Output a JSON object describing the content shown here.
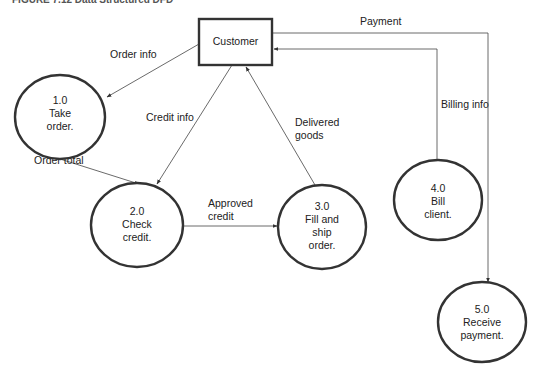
{
  "caption": "FIGURE 7.12  Data Structured DFD",
  "entities": [
    {
      "id": "customer",
      "label": "Customer"
    }
  ],
  "processes": [
    {
      "id": "p1",
      "lines": [
        "1.0",
        "Take",
        "order."
      ]
    },
    {
      "id": "p2",
      "lines": [
        "2.0",
        "Check",
        "credit."
      ]
    },
    {
      "id": "p3",
      "lines": [
        "3.0",
        "Fill and",
        "ship",
        "order."
      ]
    },
    {
      "id": "p4",
      "lines": [
        "4.0",
        "Bill",
        "client."
      ]
    },
    {
      "id": "p5",
      "lines": [
        "5.0",
        "Receive",
        "payment."
      ]
    }
  ],
  "flows": [
    {
      "id": "order-info",
      "from": "customer",
      "to": "p1",
      "label": [
        "Order info"
      ]
    },
    {
      "id": "credit-info",
      "from": "customer",
      "to": "p2",
      "label": [
        "Credit info"
      ]
    },
    {
      "id": "order-total",
      "from": "p1",
      "to": "p2",
      "label": [
        "Order total"
      ]
    },
    {
      "id": "approved-credit",
      "from": "p2",
      "to": "p3",
      "label": [
        "Approved",
        "credit"
      ]
    },
    {
      "id": "delivered-goods",
      "from": "p3",
      "to": "customer",
      "label": [
        "Delivered",
        "goods"
      ]
    },
    {
      "id": "billing-info",
      "from": "p4",
      "to": "customer",
      "label": [
        "Billing info"
      ]
    },
    {
      "id": "payment",
      "from": "customer",
      "to": "p5",
      "label": [
        "Payment"
      ]
    }
  ],
  "colors": {
    "stroke": "#333333",
    "line": "#444444",
    "text": "#222222"
  }
}
